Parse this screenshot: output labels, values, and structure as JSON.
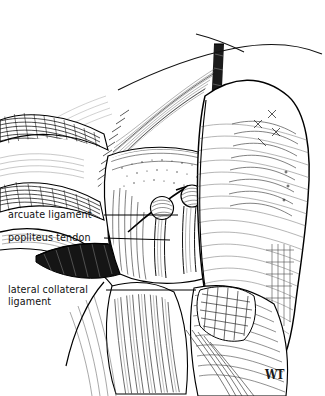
{
  "figure": {
    "kind": "anatomical-line-illustration",
    "technique": "pen-and-ink hatching",
    "background_color": "#ffffff",
    "ink_color": "#000000",
    "width": 325,
    "height": 396
  },
  "labels": [
    {
      "id": "arcuate-ligament",
      "text": "arcuate ligament",
      "x": 8,
      "y": 209,
      "leader_from_x": 104,
      "leader_from_y": 215,
      "leader_to_x": 178,
      "leader_to_y": 215
    },
    {
      "id": "popliteus-tendon",
      "text": "popliteus tendon",
      "x": 8,
      "y": 232,
      "leader_from_x": 104,
      "leader_from_y": 238,
      "leader_to_x": 170,
      "leader_to_y": 240
    },
    {
      "id": "lateral-collateral-ligament",
      "line1": "lateral collateral",
      "line2": "ligament",
      "text": "lateral collateral ligament",
      "x": 8,
      "y": 284,
      "leader_from_x": 106,
      "leader_from_y": 290,
      "leader_to_x": 196,
      "leader_to_y": 290
    }
  ],
  "signature": {
    "text": "WT",
    "x": 265,
    "y": 369
  },
  "structures": [
    {
      "name": "biceps-femoris-band",
      "region": "upper-right-diagonal-strip"
    },
    {
      "name": "gastrocnemius-lateral-head",
      "region": "right-muscle-belly"
    },
    {
      "name": "fascial-bands",
      "region": "upper-left-sweep"
    },
    {
      "name": "fabella-condyle-bulbs",
      "region": "center-joint"
    },
    {
      "name": "popliteus-tendon-wedge",
      "region": "center-left-dark-wedge"
    },
    {
      "name": "fibular-head",
      "region": "lower-center"
    },
    {
      "name": "soleus-fibers",
      "region": "lower-right"
    }
  ]
}
